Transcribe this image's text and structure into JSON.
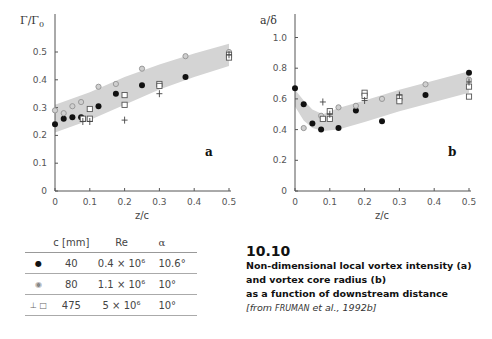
{
  "chart_data": [
    {
      "type": "scatter",
      "panel_label": "a",
      "ylabel": "Γ/Γ₀",
      "ylabel_main": "Γ/Γ",
      "ylabel_sub": "0",
      "xlabel": "z/c",
      "xlim": [
        0,
        0.5
      ],
      "ylim": [
        0,
        0.5
      ],
      "xticks": [
        "0",
        "0.1",
        "0.2",
        "0.3",
        "0.4",
        "0.5"
      ],
      "yticks": [
        "0",
        "0.1",
        "0.2",
        "0.3",
        "0.4",
        "0.5"
      ],
      "xtick_values": [
        0,
        0.1,
        0.2,
        0.3,
        0.4,
        0.5
      ],
      "ytick_values": [
        0,
        0.1,
        0.2,
        0.3,
        0.4,
        0.5
      ],
      "band": {
        "x": [
          0,
          0.1,
          0.2,
          0.3,
          0.4,
          0.5
        ],
        "lower": [
          0.21,
          0.255,
          0.31,
          0.365,
          0.41,
          0.45
        ],
        "upper": [
          0.31,
          0.355,
          0.41,
          0.455,
          0.495,
          0.53
        ]
      },
      "series": [
        {
          "name": "c=40mm",
          "marker": "filled-circle",
          "points": [
            [
              0,
              0.24
            ],
            [
              0.025,
              0.26
            ],
            [
              0.05,
              0.265
            ],
            [
              0.075,
              0.265
            ],
            [
              0.125,
              0.305
            ],
            [
              0.175,
              0.35
            ],
            [
              0.25,
              0.38
            ],
            [
              0.375,
              0.41
            ]
          ]
        },
        {
          "name": "c=80mm",
          "marker": "gray-circle",
          "points": [
            [
              0,
              0.29
            ],
            [
              0.025,
              0.28
            ],
            [
              0.05,
              0.305
            ],
            [
              0.075,
              0.32
            ],
            [
              0.125,
              0.375
            ],
            [
              0.175,
              0.385
            ],
            [
              0.25,
              0.44
            ],
            [
              0.375,
              0.485
            ],
            [
              0.5,
              0.5
            ]
          ]
        },
        {
          "name": "c=475mm (square)",
          "marker": "square",
          "points": [
            [
              0.08,
              0.26
            ],
            [
              0.1,
              0.295
            ],
            [
              0.1,
              0.26
            ],
            [
              0.2,
              0.345
            ],
            [
              0.2,
              0.31
            ],
            [
              0.3,
              0.385
            ],
            [
              0.3,
              0.378
            ],
            [
              0.5,
              0.49
            ],
            [
              0.5,
              0.48
            ]
          ]
        },
        {
          "name": "c=475mm (cross)",
          "marker": "plus",
          "points": [
            [
              0.08,
              0.25
            ],
            [
              0.1,
              0.25
            ],
            [
              0.2,
              0.255
            ],
            [
              0.3,
              0.35
            ],
            [
              0.5,
              0.49
            ]
          ]
        }
      ]
    },
    {
      "type": "scatter",
      "panel_label": "b",
      "ylabel": "a/δ",
      "xlabel": "z/c",
      "xlim": [
        0,
        0.5
      ],
      "ylim": [
        0,
        1.1
      ],
      "xticks": [
        "0",
        "0.1",
        "0.2",
        "0.3",
        "0.4",
        "0.5"
      ],
      "yticks": [
        "0",
        "0.2",
        "0.4",
        "0.6",
        "0.8",
        "1.0"
      ],
      "xtick_values": [
        0,
        0.1,
        0.2,
        0.3,
        0.4,
        0.5
      ],
      "ytick_values": [
        0,
        0.2,
        0.4,
        0.6,
        0.8,
        1.0
      ],
      "band": {
        "x": [
          0,
          0.025,
          0.05,
          0.08,
          0.125,
          0.2,
          0.3,
          0.4,
          0.5
        ],
        "lower": [
          0.55,
          0.46,
          0.41,
          0.39,
          0.4,
          0.45,
          0.52,
          0.58,
          0.64
        ],
        "upper": [
          0.66,
          0.59,
          0.53,
          0.5,
          0.54,
          0.59,
          0.66,
          0.72,
          0.78
        ]
      },
      "series": [
        {
          "name": "c=40mm",
          "marker": "filled-circle",
          "points": [
            [
              0,
              0.67
            ],
            [
              0.025,
              0.565
            ],
            [
              0.05,
              0.44
            ],
            [
              0.075,
              0.4
            ],
            [
              0.125,
              0.41
            ],
            [
              0.175,
              0.525
            ],
            [
              0.25,
              0.455
            ],
            [
              0.375,
              0.625
            ],
            [
              0.5,
              0.77
            ]
          ]
        },
        {
          "name": "c=80mm",
          "marker": "gray-circle",
          "points": [
            [
              0.025,
              0.41
            ],
            [
              0.075,
              0.49
            ],
            [
              0.125,
              0.545
            ],
            [
              0.175,
              0.555
            ],
            [
              0.25,
              0.6
            ],
            [
              0.375,
              0.695
            ],
            [
              0.5,
              0.725
            ]
          ]
        },
        {
          "name": "c=475mm (square)",
          "marker": "square",
          "points": [
            [
              0.08,
              0.47
            ],
            [
              0.1,
              0.52
            ],
            [
              0.1,
              0.47
            ],
            [
              0.2,
              0.64
            ],
            [
              0.2,
              0.62
            ],
            [
              0.3,
              0.61
            ],
            [
              0.3,
              0.585
            ],
            [
              0.5,
              0.68
            ],
            [
              0.5,
              0.615
            ]
          ]
        },
        {
          "name": "c=475mm (cross)",
          "marker": "plus",
          "points": [
            [
              0.08,
              0.58
            ],
            [
              0.1,
              0.5
            ],
            [
              0.2,
              0.59
            ],
            [
              0.3,
              0.625
            ],
            [
              0.5,
              0.71
            ]
          ]
        }
      ]
    }
  ],
  "legend_table": {
    "headers": [
      "",
      "c  [mm]",
      "Re",
      "α"
    ],
    "rows": [
      {
        "symbol": "●",
        "c": "40",
        "re": "0.4 × 10⁶",
        "alpha": "10.6°"
      },
      {
        "symbol": "◉",
        "c": "80",
        "re": "1.1 × 10⁶",
        "alpha": "10°"
      },
      {
        "symbol": "⊥ □",
        "c": "475",
        "re": "5 × 10⁶",
        "alpha": "10°"
      }
    ]
  },
  "caption": {
    "number": "10.10",
    "lines": [
      "Non-dimensional local vortex intensity (a)",
      "and vortex core radius (b)",
      "as a function of downstream distance"
    ],
    "source_prefix": "[from ",
    "source_author": "Fruman",
    "source_suffix": " et al., 1992b]"
  },
  "colors": {
    "band": "#d4d4d4",
    "filled": "#111111",
    "gray": "#999999",
    "axis": "#555555"
  }
}
